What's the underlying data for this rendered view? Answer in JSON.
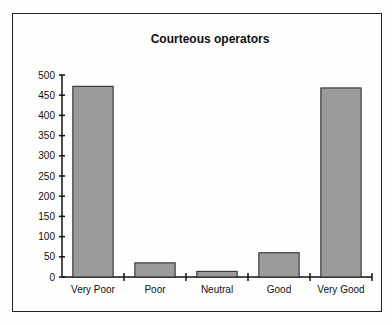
{
  "chart_data": {
    "type": "bar",
    "title": "Courteous operators",
    "xlabel": "",
    "ylabel": "",
    "categories": [
      "Very Poor",
      "Poor",
      "Neutral",
      "Good",
      "Very Good"
    ],
    "values": [
      472,
      35,
      14,
      60,
      468
    ],
    "ylim": [
      0,
      500
    ],
    "yticks": [
      0,
      50,
      100,
      150,
      200,
      250,
      300,
      350,
      400,
      450,
      500
    ],
    "grid": false,
    "legend": "none",
    "bar_color": "#9a9a9a"
  }
}
